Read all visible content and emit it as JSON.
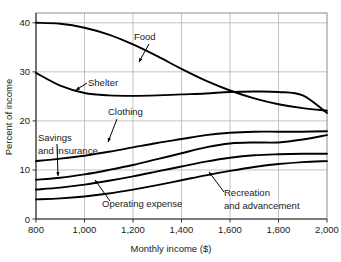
{
  "chart_data": {
    "type": "line",
    "title": "",
    "xlabel": "Monthly income ($)",
    "ylabel": "Percent of income",
    "xlim": [
      800,
      2000
    ],
    "ylim": [
      0,
      42
    ],
    "xticks": [
      800,
      1000,
      1200,
      1400,
      1600,
      1800,
      2000
    ],
    "xtick_labels": [
      "800",
      "1,000",
      "1,200",
      "1,400",
      "1,600",
      "1,800",
      "2,000"
    ],
    "yticks": [
      0,
      10,
      20,
      30,
      40
    ],
    "ytick_labels": [
      "0",
      "10",
      "20",
      "30",
      "40"
    ],
    "grid": true,
    "legend_position": "inline-annotations",
    "line_color": "#000000",
    "grid_color": "#b4b4b4",
    "frame_color": "#8c8c8c",
    "x": [
      800,
      900,
      1000,
      1100,
      1200,
      1300,
      1400,
      1500,
      1600,
      1700,
      1800,
      1900,
      2000
    ],
    "series": [
      {
        "name": "Food",
        "values": [
          40.0,
          39.8,
          39.0,
          37.6,
          35.6,
          33.2,
          30.6,
          28.2,
          26.2,
          24.6,
          23.4,
          22.6,
          22.1
        ]
      },
      {
        "name": "Shelter",
        "values": [
          29.8,
          27.2,
          25.7,
          25.2,
          25.1,
          25.2,
          25.4,
          25.6,
          25.9,
          26.0,
          25.9,
          25.2,
          21.6
        ]
      },
      {
        "name": "Clothing",
        "values": [
          11.8,
          12.3,
          12.9,
          13.7,
          14.6,
          15.5,
          16.3,
          17.1,
          17.6,
          17.8,
          17.8,
          17.8,
          17.9
        ]
      },
      {
        "name": "Savings and insurance",
        "values": [
          8.0,
          8.4,
          9.1,
          10.0,
          11.0,
          12.2,
          13.4,
          14.6,
          15.4,
          15.6,
          15.6,
          16.2,
          17.1
        ]
      },
      {
        "name": "Operating expense",
        "values": [
          6.0,
          6.4,
          7.0,
          7.8,
          8.7,
          9.7,
          10.7,
          11.7,
          12.5,
          13.0,
          13.2,
          13.3,
          13.3
        ]
      },
      {
        "name": "Recreation and advancement",
        "values": [
          4.0,
          4.2,
          4.6,
          5.2,
          6.0,
          6.9,
          7.9,
          8.9,
          9.8,
          10.6,
          11.2,
          11.6,
          11.8
        ]
      }
    ],
    "annotations": [
      {
        "label": "Food",
        "lines": [
          "Food"
        ]
      },
      {
        "label": "Shelter",
        "lines": [
          "Shelter"
        ]
      },
      {
        "label": "Clothing",
        "lines": [
          "Clothing"
        ]
      },
      {
        "label": "Savings and insurance",
        "lines": [
          "Savings",
          "and insurance"
        ]
      },
      {
        "label": "Operating expense",
        "lines": [
          "Operating expense"
        ]
      },
      {
        "label": "Recreation and advancement",
        "lines": [
          "Recreation",
          "and advancement"
        ]
      }
    ]
  }
}
